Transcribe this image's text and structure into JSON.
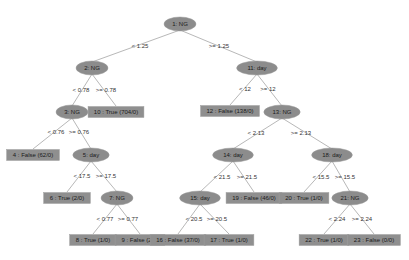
{
  "diagram": {
    "type": "decision-tree",
    "colors": {
      "node_fill": "#8c8c8c",
      "edge": "#b8b8b8",
      "text": "#1a1a1a",
      "background": "#ffffff"
    },
    "nodes": [
      {
        "id": "1",
        "kind": "split",
        "label": "1: NG",
        "x": 180,
        "y": 24
      },
      {
        "id": "2",
        "kind": "split",
        "label": "2: NG",
        "x": 92,
        "y": 68
      },
      {
        "id": "11",
        "kind": "split",
        "label": "11: day",
        "x": 257,
        "y": 68
      },
      {
        "id": "3",
        "kind": "split",
        "label": "3: NG",
        "x": 72,
        "y": 112
      },
      {
        "id": "10",
        "kind": "leaf",
        "label": "10 : True (704/0)",
        "x": 116,
        "y": 112
      },
      {
        "id": "4",
        "kind": "leaf",
        "label": "4 : False (62/0)",
        "x": 33,
        "y": 155
      },
      {
        "id": "5",
        "kind": "split",
        "label": "5: day",
        "x": 91,
        "y": 155
      },
      {
        "id": "6",
        "kind": "leaf",
        "label": "6 : True (2/0)",
        "x": 67,
        "y": 198
      },
      {
        "id": "7",
        "kind": "split",
        "label": "7: NG",
        "x": 117,
        "y": 198
      },
      {
        "id": "8",
        "kind": "leaf",
        "label": "8 : True (1/0)",
        "x": 93,
        "y": 240
      },
      {
        "id": "9",
        "kind": "leaf",
        "label": "9 : False (2/0)",
        "x": 140,
        "y": 240
      },
      {
        "id": "12",
        "kind": "leaf",
        "label": "12 : False (138/0)",
        "x": 230,
        "y": 111
      },
      {
        "id": "13",
        "kind": "split",
        "label": "13: NG",
        "x": 282,
        "y": 112
      },
      {
        "id": "14",
        "kind": "split",
        "label": "14: day",
        "x": 233,
        "y": 155
      },
      {
        "id": "18",
        "kind": "split",
        "label": "18: day",
        "x": 332,
        "y": 155
      },
      {
        "id": "15",
        "kind": "split",
        "label": "15: day",
        "x": 200,
        "y": 198
      },
      {
        "id": "19",
        "kind": "leaf",
        "label": "19 : False (46/0)",
        "x": 254,
        "y": 198
      },
      {
        "id": "16",
        "kind": "leaf",
        "label": "16 : False (37/0)",
        "x": 178,
        "y": 240
      },
      {
        "id": "17",
        "kind": "leaf",
        "label": "17 : True (1/0)",
        "x": 229,
        "y": 240
      },
      {
        "id": "20",
        "kind": "leaf",
        "label": "20 : True (1/0)",
        "x": 304,
        "y": 198
      },
      {
        "id": "21",
        "kind": "split",
        "label": "21: NG",
        "x": 350,
        "y": 198
      },
      {
        "id": "22",
        "kind": "leaf",
        "label": "22 : True (1/0)",
        "x": 324,
        "y": 240
      },
      {
        "id": "23",
        "kind": "leaf",
        "label": "23 : False (0/0)",
        "x": 374,
        "y": 240
      }
    ],
    "edges": [
      {
        "from": "1",
        "to": "2",
        "label": "< 1.25",
        "lx": 140,
        "ly": 46
      },
      {
        "from": "1",
        "to": "11",
        "label": ">= 1.25",
        "lx": 219,
        "ly": 46
      },
      {
        "from": "2",
        "to": "3",
        "label": "< 0.78",
        "lx": 81,
        "ly": 90
      },
      {
        "from": "2",
        "to": "10",
        "label": ">= 0.78",
        "lx": 106,
        "ly": 90
      },
      {
        "from": "3",
        "to": "4",
        "label": "< 0.76",
        "lx": 56,
        "ly": 132
      },
      {
        "from": "3",
        "to": "5",
        "label": ">= 0.76",
        "lx": 79,
        "ly": 132
      },
      {
        "from": "5",
        "to": "6",
        "label": "< 17.5",
        "lx": 82,
        "ly": 176
      },
      {
        "from": "5",
        "to": "7",
        "label": ">= 17.5",
        "lx": 106,
        "ly": 176
      },
      {
        "from": "7",
        "to": "8",
        "label": "< 0.77",
        "lx": 105,
        "ly": 219
      },
      {
        "from": "7",
        "to": "9",
        "label": ">= 0.77",
        "lx": 128,
        "ly": 219
      },
      {
        "from": "11",
        "to": "12",
        "label": "< 12",
        "lx": 245,
        "ly": 89
      },
      {
        "from": "11",
        "to": "13",
        "label": ">= 12",
        "lx": 268,
        "ly": 89
      },
      {
        "from": "13",
        "to": "14",
        "label": "< 2.13",
        "lx": 256,
        "ly": 133
      },
      {
        "from": "13",
        "to": "18",
        "label": ">= 2.13",
        "lx": 301,
        "ly": 133
      },
      {
        "from": "14",
        "to": "15",
        "label": "< 21.5",
        "lx": 222,
        "ly": 177
      },
      {
        "from": "14",
        "to": "19",
        "label": ">= 21.5",
        "lx": 247,
        "ly": 177
      },
      {
        "from": "15",
        "to": "16",
        "label": "< 20.5",
        "lx": 194,
        "ly": 219
      },
      {
        "from": "15",
        "to": "17",
        "label": ">= 20.5",
        "lx": 217,
        "ly": 219
      },
      {
        "from": "18",
        "to": "20",
        "label": "< 15.5",
        "lx": 321,
        "ly": 177
      },
      {
        "from": "18",
        "to": "21",
        "label": ">= 15.5",
        "lx": 345,
        "ly": 177
      },
      {
        "from": "21",
        "to": "22",
        "label": "< 2.24",
        "lx": 337,
        "ly": 219
      },
      {
        "from": "21",
        "to": "23",
        "label": ">= 2.24",
        "lx": 362,
        "ly": 219
      }
    ]
  }
}
